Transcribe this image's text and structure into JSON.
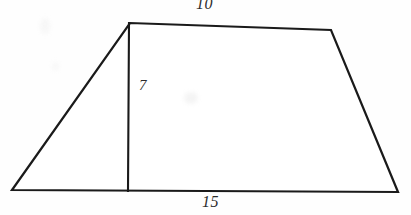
{
  "figure": {
    "kind": "geometry-diagram",
    "shape": "trapezoid-with-height-segment",
    "stroke_color": "#1a1a1a",
    "fill_color": "#ffffff",
    "background_color": "#fefefe",
    "label_color": "#2b2b2b",
    "canvas": {
      "width": 411,
      "height": 215
    },
    "vertices": {
      "bottom_left": {
        "x": 12,
        "y": 190
      },
      "top_left": {
        "x": 130,
        "y": 23
      },
      "top_right": {
        "x": 331,
        "y": 30
      },
      "bottom_right": {
        "x": 398,
        "y": 192
      },
      "height_foot": {
        "x": 128,
        "y": 191
      }
    },
    "labels": {
      "top_side": "10",
      "height": "7",
      "bottom_side": "15"
    }
  }
}
